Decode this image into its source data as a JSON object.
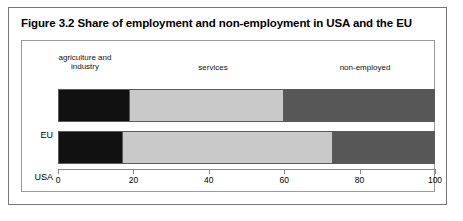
{
  "figure": {
    "title": "Figure 3.2 Share of employment and non-employment in USA and the EU"
  },
  "chart_data": {
    "type": "bar",
    "orientation": "horizontal",
    "stacked": true,
    "title": "Figure 3.2 Share of employment and non-employment in USA and the EU",
    "xlabel": "",
    "ylabel": "",
    "xlim": [
      0,
      100
    ],
    "xticks": [
      0,
      20,
      40,
      60,
      80,
      100
    ],
    "xtick_labels": [
      "0",
      "20",
      "40",
      "60",
      "80",
      "100"
    ],
    "grid": false,
    "legend_position": "above-bars-inline",
    "categories": [
      "EU",
      "USA"
    ],
    "series": [
      {
        "name": "agriculture and industry",
        "label": "agriculture and\nindustry",
        "color": "#111111",
        "values": [
          19,
          17
        ]
      },
      {
        "name": "services",
        "label": "services",
        "color": "#c9c9c9",
        "values": [
          41,
          56
        ]
      },
      {
        "name": "non-employed",
        "label": "non-employed",
        "color": "#575757",
        "values": [
          40,
          27
        ]
      }
    ],
    "cumulative_boundaries": {
      "EU": [
        19,
        60,
        100
      ],
      "USA": [
        17,
        73,
        100
      ]
    }
  }
}
